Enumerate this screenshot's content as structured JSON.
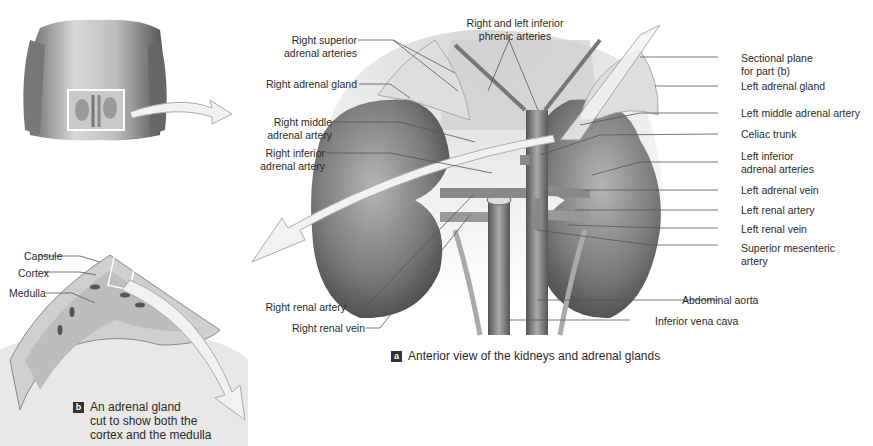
{
  "figure_a": {
    "badge": "a",
    "caption": "Anterior view of the kidneys and adrenal glands",
    "labels_left": {
      "right_superior_adrenal_arteries": [
        "Right superior",
        "adrenal arteries"
      ],
      "right_adrenal_gland": "Right adrenal gland",
      "right_middle_adrenal_artery": [
        "Right middle",
        "adrenal artery"
      ],
      "right_inferior_adrenal_artery": [
        "Right inferior",
        "adrenal artery"
      ],
      "right_renal_artery": "Right renal artery",
      "right_renal_vein": "Right renal vein"
    },
    "labels_top": {
      "inferior_phrenic_arteries": [
        "Right and left inferior",
        "phrenic arteries"
      ]
    },
    "labels_right": {
      "sectional_plane": [
        "Sectional plane",
        "for part (b)"
      ],
      "left_adrenal_gland": "Left adrenal gland",
      "left_middle_adrenal_artery": "Left middle adrenal artery",
      "celiac_trunk": "Celiac trunk",
      "left_inferior_adrenal_arteries": [
        "Left inferior",
        "adrenal arteries"
      ],
      "left_adrenal_vein": "Left adrenal vein",
      "left_renal_artery": "Left renal artery",
      "left_renal_vein": "Left renal vein",
      "superior_mesenteric_artery": [
        "Superior mesenteric",
        "artery"
      ],
      "abdominal_aorta": "Abdominal aorta",
      "inferior_vena_cava": "Inferior vena cava"
    }
  },
  "figure_b": {
    "badge": "b",
    "caption": [
      "An adrenal gland",
      "cut to show both the",
      "cortex and the medulla"
    ],
    "labels": {
      "capsule": "Capsule",
      "cortex": "Cortex",
      "medulla": "Medulla"
    }
  },
  "colors": {
    "background": "#ffffff",
    "text": "#2b2b2b",
    "leader_line": "#555555",
    "kidney": "#8a8a8a",
    "adrenal": "#d9d9d9",
    "arrow_fill": "#f2f2f2",
    "badge_bg": "#333333"
  }
}
